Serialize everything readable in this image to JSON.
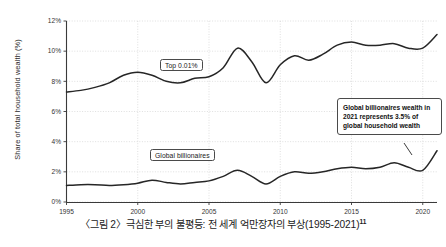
{
  "caption": {
    "text": "〈그림 2〉극심한 부의 불평등: 전 세계 억만장자의 부상(1995-2021)",
    "footnote_marker": "11"
  },
  "annotation": {
    "text": "Global billionaires wealth in 2021 represents 3.5% of global household wealth"
  },
  "labels": {
    "top_share": "Top 0.01%",
    "billionaires": "Global billionaires"
  },
  "colors": {
    "line": "#262626",
    "grid": "#c9c9c9",
    "axis": "#3a3a3a",
    "background": "#ffffff"
  },
  "chart_data": {
    "type": "line",
    "title": "",
    "xlabel": "",
    "ylabel": "Share of total household wealth (%)",
    "xlim": [
      1995,
      2021
    ],
    "ylim": [
      0,
      12
    ],
    "ytick_labels": [
      "0%",
      "2%",
      "4%",
      "6%",
      "8%",
      "10%",
      "12%"
    ],
    "ytick_values": [
      0,
      2,
      4,
      6,
      8,
      10,
      12
    ],
    "xtick_labels": [
      "1995",
      "2000",
      "2005",
      "2010",
      "2015",
      "2020"
    ],
    "xtick_values": [
      1995,
      2000,
      2005,
      2010,
      2015,
      2020
    ],
    "grid": "dotted-both",
    "legend": "inline-labels",
    "x": [
      1995,
      1996,
      1997,
      1998,
      1999,
      2000,
      2001,
      2002,
      2003,
      2004,
      2005,
      2006,
      2007,
      2008,
      2009,
      2010,
      2011,
      2012,
      2013,
      2014,
      2015,
      2016,
      2017,
      2018,
      2019,
      2020,
      2021
    ],
    "series": [
      {
        "name": "Top 0.01%",
        "values": [
          7.3,
          7.4,
          7.6,
          7.9,
          8.4,
          8.6,
          8.4,
          8.0,
          7.9,
          8.2,
          8.3,
          8.9,
          10.2,
          9.3,
          7.9,
          9.1,
          9.7,
          9.4,
          9.8,
          10.4,
          10.6,
          10.4,
          10.4,
          10.5,
          10.2,
          10.2,
          11.1
        ]
      },
      {
        "name": "Global billionaires",
        "values": [
          1.1,
          1.15,
          1.15,
          1.1,
          1.15,
          1.25,
          1.45,
          1.3,
          1.2,
          1.3,
          1.4,
          1.7,
          2.1,
          1.7,
          1.2,
          1.7,
          2.0,
          1.9,
          2.0,
          2.2,
          2.3,
          2.2,
          2.3,
          2.6,
          2.3,
          2.1,
          3.4
        ]
      }
    ],
    "annotations": [
      {
        "label": "Global billionaires wealth in 2021 represents 3.5% of global household wealth",
        "points_to": {
          "x": 2021,
          "y": 3.4
        }
      }
    ]
  }
}
